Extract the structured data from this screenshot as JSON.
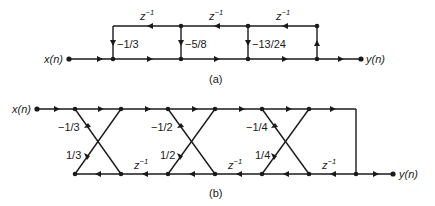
{
  "diagram_a": {
    "caption": "(a)",
    "input_label": "x(n)",
    "output_label": "y(n)",
    "delay_labels": [
      "z",
      "z",
      "z"
    ],
    "delay_exp": "−1",
    "gains": [
      "−1/3",
      "−5/8",
      "−13/24"
    ]
  },
  "diagram_b": {
    "caption": "(b)",
    "input_label": "x(n)",
    "output_label": "y(n)",
    "delay_labels": [
      "z",
      "z",
      "z"
    ],
    "delay_exp": "−1",
    "stages": [
      {
        "upper_gain": "−1/3",
        "lower_gain": "1/3"
      },
      {
        "upper_gain": "−1/2",
        "lower_gain": "1/2"
      },
      {
        "upper_gain": "−1/4",
        "lower_gain": "1/4"
      }
    ]
  }
}
